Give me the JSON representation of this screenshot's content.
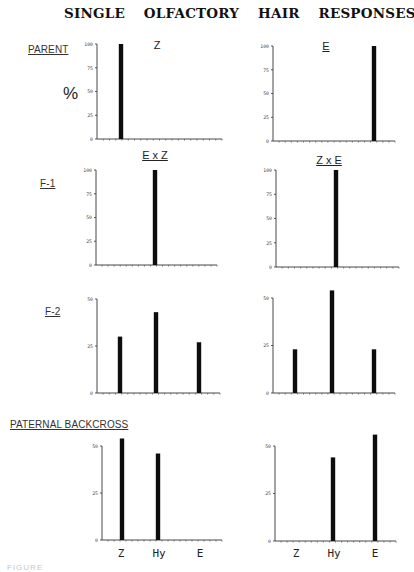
{
  "title": "SINGLE OLFACTORY HAIR RESPONSES",
  "y_unit_label": "%",
  "row_labels": {
    "parent": "PARENT",
    "f1": "F-1",
    "f2": "F-2",
    "backcross": "PATERNAL BACKCROSS"
  },
  "panel_titles": {
    "parent_left": "Z",
    "parent_right": "E",
    "f1_left": "E x Z",
    "f1_right": "Z x E"
  },
  "x_category_labels": [
    "Z",
    "Hy",
    "E"
  ],
  "caption": "FIGURE",
  "chart_data": [
    {
      "id": "parent-z",
      "type": "bar",
      "row": "PARENT",
      "title": "Z",
      "xlabel": "",
      "ylabel": "%",
      "ylim": [
        0,
        100
      ],
      "yticks": [
        0,
        25,
        50,
        75,
        100
      ],
      "categories": [
        "Z",
        "Hy",
        "E"
      ],
      "values": [
        100,
        0,
        0
      ],
      "grid": false
    },
    {
      "id": "parent-e",
      "type": "bar",
      "row": "PARENT",
      "title": "E",
      "xlabel": "",
      "ylabel": "%",
      "ylim": [
        0,
        100
      ],
      "yticks": [
        0,
        25,
        50,
        75,
        100
      ],
      "categories": [
        "Z",
        "Hy",
        "E"
      ],
      "values": [
        0,
        0,
        100
      ],
      "grid": false
    },
    {
      "id": "f1-exz",
      "type": "bar",
      "row": "F-1",
      "title": "E x Z",
      "xlabel": "",
      "ylabel": "%",
      "ylim": [
        0,
        100
      ],
      "yticks": [
        0,
        25,
        50,
        75,
        100
      ],
      "categories": [
        "Z",
        "Hy",
        "E"
      ],
      "values": [
        0,
        100,
        0
      ],
      "grid": false
    },
    {
      "id": "f1-zxe",
      "type": "bar",
      "row": "F-1",
      "title": "Z x E",
      "xlabel": "",
      "ylabel": "%",
      "ylim": [
        0,
        100
      ],
      "yticks": [
        0,
        25,
        50,
        75,
        100
      ],
      "categories": [
        "Z",
        "Hy",
        "E"
      ],
      "values": [
        0,
        100,
        0
      ],
      "grid": false
    },
    {
      "id": "f2-left",
      "type": "bar",
      "row": "F-2",
      "title": "",
      "xlabel": "",
      "ylabel": "%",
      "ylim": [
        0,
        50
      ],
      "yticks": [
        0,
        25,
        50
      ],
      "categories": [
        "Z",
        "Hy",
        "E"
      ],
      "values": [
        30,
        43,
        27
      ],
      "grid": false
    },
    {
      "id": "f2-right",
      "type": "bar",
      "row": "F-2",
      "title": "",
      "xlabel": "",
      "ylabel": "%",
      "ylim": [
        0,
        50
      ],
      "yticks": [
        0,
        25,
        50
      ],
      "categories": [
        "Z",
        "Hy",
        "E"
      ],
      "values": [
        23,
        54,
        23
      ],
      "grid": false
    },
    {
      "id": "backcross-left",
      "type": "bar",
      "row": "PATERNAL BACKCROSS",
      "title": "",
      "xlabel": "",
      "ylabel": "%",
      "ylim": [
        0,
        50
      ],
      "yticks": [
        0,
        25,
        50
      ],
      "categories": [
        "Z",
        "Hy",
        "E"
      ],
      "values": [
        54,
        46,
        0
      ],
      "grid": false
    },
    {
      "id": "backcross-right",
      "type": "bar",
      "row": "PATERNAL BACKCROSS",
      "title": "",
      "xlabel": "",
      "ylabel": "%",
      "ylim": [
        0,
        50
      ],
      "yticks": [
        0,
        25,
        50
      ],
      "categories": [
        "Z",
        "Hy",
        "E"
      ],
      "values": [
        0,
        44,
        56
      ],
      "grid": false
    }
  ]
}
